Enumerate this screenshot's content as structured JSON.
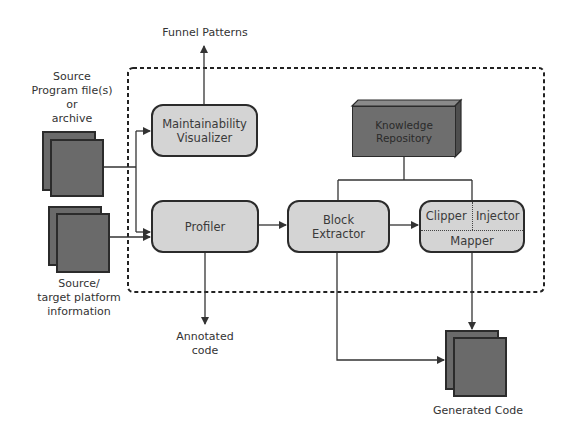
{
  "diagram": {
    "inputs": {
      "source_program": {
        "label_lines": [
          "Source",
          "Program file(s)",
          "or",
          "archive"
        ]
      },
      "platform_info": {
        "label_lines": [
          "Source/",
          "target platform",
          "information"
        ]
      }
    },
    "outputs": {
      "funnel_patterns": "Funnel Patterns",
      "annotated_code": {
        "label_lines": [
          "Annotated",
          "code"
        ]
      },
      "generated_code": "Generated Code"
    },
    "components": {
      "maintainability_visualizer": {
        "label_lines": [
          "Maintainability",
          "Visualizer"
        ]
      },
      "profiler": {
        "label": "Profiler"
      },
      "block_extractor": {
        "label_lines": [
          "Block",
          "Extractor"
        ]
      },
      "knowledge_repository": {
        "label_lines": [
          "Knowledge",
          "Repository"
        ]
      },
      "transformer": {
        "clipper": "Clipper",
        "injector": "Injector",
        "mapper": "Mapper"
      }
    },
    "colors": {
      "box_fill": "#d4d4d4",
      "box_border": "#2b2b2b",
      "document_fill": "#6a6a6a",
      "repository_fill": "#6e6e6e",
      "line": "#333333",
      "background": "#ffffff"
    },
    "edges": [
      {
        "from": "source_program",
        "to": "maintainability_visualizer"
      },
      {
        "from": "source_program",
        "to": "profiler"
      },
      {
        "from": "platform_info",
        "to": "profiler"
      },
      {
        "from": "maintainability_visualizer",
        "to": "funnel_patterns"
      },
      {
        "from": "profiler",
        "to": "block_extractor"
      },
      {
        "from": "profiler",
        "to": "annotated_code"
      },
      {
        "from": "block_extractor",
        "to": "transformer"
      },
      {
        "from": "knowledge_repository",
        "to": "block_extractor"
      },
      {
        "from": "knowledge_repository",
        "to": "transformer"
      },
      {
        "from": "block_extractor",
        "to": "generated_code"
      },
      {
        "from": "transformer",
        "to": "generated_code"
      }
    ]
  }
}
